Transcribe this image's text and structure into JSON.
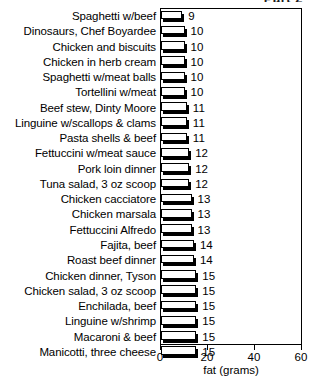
{
  "part_title": "Part 2",
  "chart_data": {
    "type": "bar",
    "orientation": "horizontal",
    "title": "",
    "xlabel": "fat (grams)",
    "ylabel": "",
    "xlim": [
      0,
      60
    ],
    "xticks": [
      0,
      20,
      40,
      60
    ],
    "xtick_labels": [
      "0",
      "20",
      "40",
      "60"
    ],
    "grid": false,
    "legend": null,
    "bar_style": {
      "face_color": "#ffffff",
      "edge_color": "#000000",
      "shadow_color": "#000000"
    },
    "categories": [
      "Spaghetti w/beef",
      "Dinosaurs, Chef Boyardee",
      "Chicken and biscuits",
      "Chicken in herb cream",
      "Spaghetti w/meat balls",
      "Tortellini w/meat",
      "Beef stew, Dinty Moore",
      "Linguine w/scallops & clams",
      "Pasta shells & beef",
      "Fettuccini w/meat sauce",
      "Pork loin dinner",
      "Tuna salad, 3 oz scoop",
      "Chicken cacciatore",
      "Chicken marsala",
      "Fettuccini Alfredo",
      "Fajita, beef",
      "Roast beef dinner",
      "Chicken dinner, Tyson",
      "Chicken salad, 3 oz scoop",
      "Enchilada, beef",
      "Linguine w/shrimp",
      "Macaroni & beef",
      "Manicotti, three cheese"
    ],
    "values": [
      9,
      10,
      10,
      10,
      10,
      10,
      11,
      11,
      11,
      12,
      12,
      12,
      13,
      13,
      13,
      14,
      14,
      15,
      15,
      15,
      15,
      15,
      15
    ],
    "value_labels": [
      "9",
      "10",
      "10",
      "10",
      "10",
      "10",
      "11",
      "11",
      "11",
      "12",
      "12",
      "12",
      "13",
      "13",
      "13",
      "14",
      "14",
      "15",
      "15",
      "15",
      "15",
      "15",
      "15"
    ]
  }
}
